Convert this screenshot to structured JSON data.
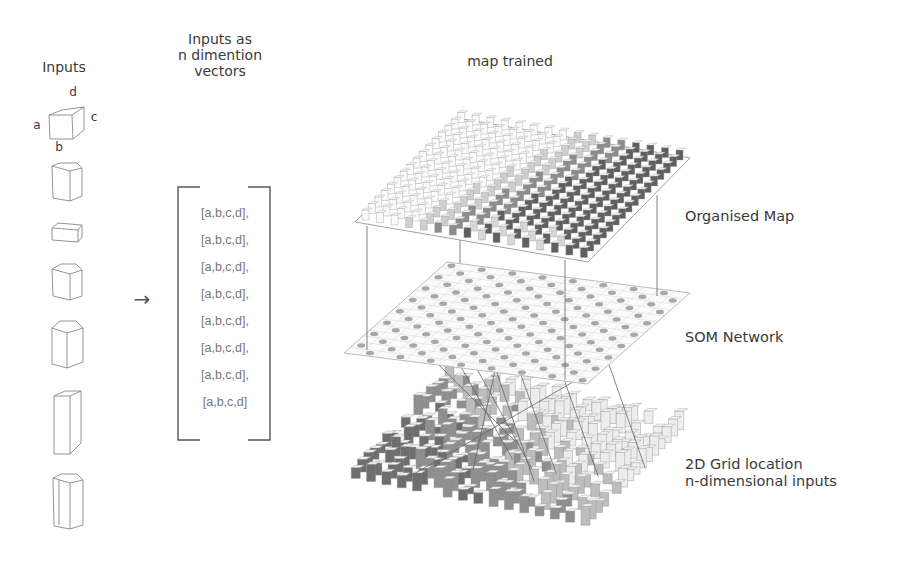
{
  "headers": {
    "inputs": "Inputs",
    "vectors": [
      "Inputs as",
      "n dimention",
      "vectors"
    ],
    "map": "map trained"
  },
  "cube_labels": {
    "a": "a",
    "b": "b",
    "c": "c",
    "d": "d"
  },
  "vector_rows": [
    "[a,b,c,d],",
    "[a,b,c,d],",
    "[a,b,c,d],",
    "[a,b,c,d],",
    "[a,b,c,d],",
    "[a,b,c,d],",
    "[a,b,c,d],",
    "[a,b,c,d]"
  ],
  "arrow": "→",
  "layers": [
    {
      "name": "Organised Map"
    },
    {
      "name": "SOM Network"
    },
    {
      "name": [
        "2D Grid location",
        "n-dimensional inputs"
      ]
    }
  ],
  "colors": {
    "line": "#666666",
    "light_cell": "#e6e6e6",
    "mid_cell": "#9a9a9a",
    "dark_cell": "#5e5e5e",
    "node": "#a8a8a8"
  }
}
